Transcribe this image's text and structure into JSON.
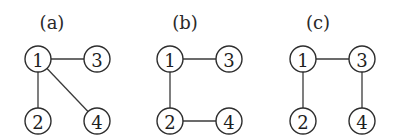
{
  "panels": [
    {
      "label": "(a)",
      "label_pos": [
        52,
        22
      ],
      "nodes": [
        {
          "id": "1",
          "x": 38,
          "y": 59
        },
        {
          "id": "2",
          "x": 38,
          "y": 121
        },
        {
          "id": "3",
          "x": 97,
          "y": 59
        },
        {
          "id": "4",
          "x": 97,
          "y": 121
        }
      ],
      "edges": [
        [
          "1",
          "3"
        ],
        [
          "1",
          "2"
        ],
        [
          "1",
          "4"
        ]
      ]
    },
    {
      "label": "(b)",
      "label_pos": [
        185,
        22
      ],
      "nodes": [
        {
          "id": "1",
          "x": 170,
          "y": 59
        },
        {
          "id": "2",
          "x": 170,
          "y": 121
        },
        {
          "id": "3",
          "x": 229,
          "y": 59
        },
        {
          "id": "4",
          "x": 229,
          "y": 121
        }
      ],
      "edges": [
        [
          "1",
          "3"
        ],
        [
          "1",
          "2"
        ],
        [
          "2",
          "4"
        ]
      ]
    },
    {
      "label": "(c)",
      "label_pos": [
        318,
        22
      ],
      "nodes": [
        {
          "id": "1",
          "x": 303,
          "y": 59
        },
        {
          "id": "2",
          "x": 303,
          "y": 121
        },
        {
          "id": "3",
          "x": 362,
          "y": 59
        },
        {
          "id": "4",
          "x": 362,
          "y": 121
        }
      ],
      "edges": [
        [
          "1",
          "3"
        ],
        [
          "1",
          "2"
        ],
        [
          "3",
          "4"
        ]
      ]
    }
  ],
  "node_radius": 13
}
